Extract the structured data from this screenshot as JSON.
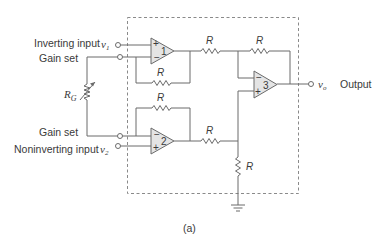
{
  "diagram": {
    "type": "instrumentation-amplifier-schematic",
    "caption": "(a)",
    "terminals": {
      "inverting_input": {
        "label": "Inverting input",
        "symbol": "v",
        "subscript": "1"
      },
      "gain_set_top": {
        "label": "Gain set"
      },
      "gain_set_bottom": {
        "label": "Gain set"
      },
      "noninverting_input": {
        "label": "Noninverting input",
        "symbol": "v",
        "subscript": "2"
      },
      "output": {
        "label": "Output",
        "symbol": "v",
        "subscript": "o"
      }
    },
    "gain_resistor": {
      "symbol": "R",
      "subscript": "G",
      "variable": true
    },
    "opamps": [
      {
        "id": "1",
        "plus": "+",
        "minus": "−",
        "top_input": "+",
        "bottom_input": "−"
      },
      {
        "id": "2",
        "plus": "+",
        "minus": "−",
        "top_input": "−",
        "bottom_input": "+"
      },
      {
        "id": "3",
        "plus": "+",
        "minus": "−",
        "top_input": "−",
        "bottom_input": "+"
      }
    ],
    "resistors": [
      {
        "name": "r-feedback-1",
        "label": "R"
      },
      {
        "name": "r-feedback-2",
        "label": "R"
      },
      {
        "name": "r-in-3-top",
        "label": "R"
      },
      {
        "name": "r-feedback-3",
        "label": "R"
      },
      {
        "name": "r-in-3-bottom",
        "label": "R"
      },
      {
        "name": "r-ground",
        "label": "R"
      }
    ],
    "ground_symbol": "ground"
  }
}
